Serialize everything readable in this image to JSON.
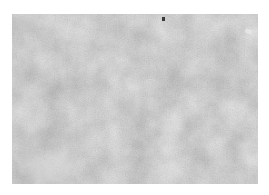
{
  "image": {
    "description": "Grayscale cloud/noise texture",
    "colors": {
      "background": "#ffffff",
      "texture_base": "#9a9a9a",
      "texture_dark": "#7e7e7e",
      "texture_light": "#b8b8b8",
      "speck": "#3a3a3a",
      "highlight": "#e6e6e6"
    }
  }
}
